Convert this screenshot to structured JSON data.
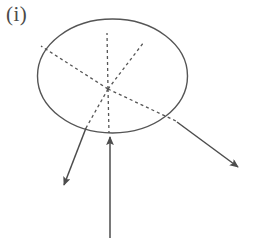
{
  "figure": {
    "panel_label": "(i)",
    "label_color": "#4a4a4a",
    "background_color": "#ffffff",
    "stroke_color": "#555555",
    "dashed_color": "#555555",
    "arrow_color": "#4d4d4d",
    "width": 260,
    "height": 247
  },
  "chart_data": {
    "type": "diagram",
    "title": "(i)",
    "ellipse": {
      "cx": 112.5,
      "cy": 76,
      "rx": 75,
      "ry": 57,
      "stroke": "#555555",
      "stroke_width": 1.4,
      "fill": "none"
    },
    "convergence_point": {
      "x": 108,
      "y": 89
    },
    "dashed_rays": [
      {
        "name": "ray-upper-left",
        "x1": 108,
        "y1": 89,
        "x2": 41,
        "y2": 46
      },
      {
        "name": "ray-up-vertical",
        "x1": 108,
        "y1": 89,
        "x2": 107,
        "y2": 33
      },
      {
        "name": "ray-upper-right",
        "x1": 108,
        "y1": 89,
        "x2": 144,
        "y2": 42
      },
      {
        "name": "ray-lower-right",
        "x1": 108,
        "y1": 89,
        "x2": 178,
        "y2": 122
      },
      {
        "name": "ray-lower-left",
        "x1": 108,
        "y1": 89,
        "x2": 86,
        "y2": 128
      },
      {
        "name": "ray-down-vertical",
        "x1": 108,
        "y1": 89,
        "x2": 109,
        "y2": 133
      }
    ],
    "arrows": [
      {
        "name": "arrow-outgoing-left",
        "direction": "down-left",
        "x1": 86,
        "y1": 128,
        "x2": 64,
        "y2": 185
      },
      {
        "name": "arrow-incoming-vertical",
        "direction": "up",
        "x1": 110,
        "y1": 238,
        "x2": 110,
        "y2": 137
      },
      {
        "name": "arrow-outgoing-right",
        "direction": "down-right",
        "x1": 177,
        "y1": 122,
        "x2": 238,
        "y2": 167
      }
    ],
    "dash_pattern": "3,3",
    "grid": false,
    "legend": null
  }
}
